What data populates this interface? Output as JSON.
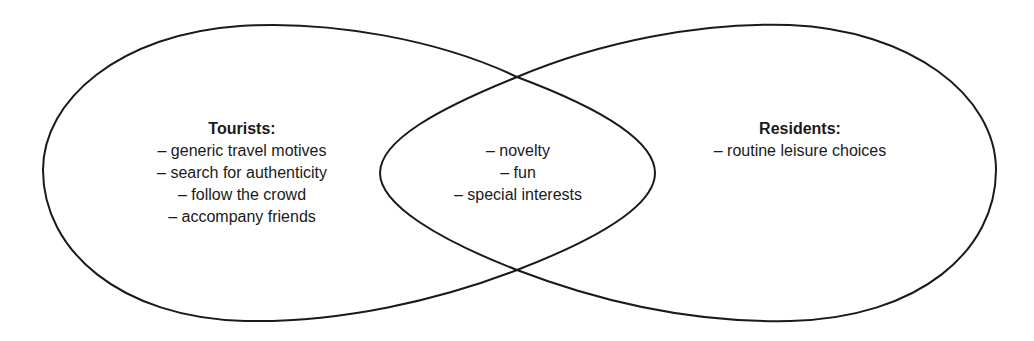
{
  "diagram": {
    "type": "venn",
    "stroke_color": "#1a1a1a",
    "background": "#ffffff",
    "sets": [
      {
        "id": "tourists",
        "heading": "Tourists:",
        "items": [
          "– generic travel motives",
          "– search for authenticity",
          "– follow the crowd",
          "– accompany friends"
        ]
      },
      {
        "id": "residents",
        "heading": "Residents:",
        "items": [
          "– routine leisure choices"
        ]
      }
    ],
    "overlap": {
      "id": "tourists-and-residents",
      "items": [
        "– novelty",
        "– fun",
        "– special interests"
      ]
    }
  }
}
